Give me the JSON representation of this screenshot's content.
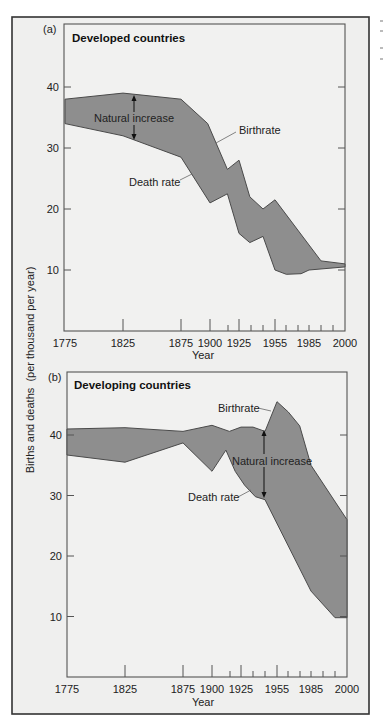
{
  "figure": {
    "ylabel": "Births and deaths  (per thousand per year)",
    "xlabel": "Year",
    "colors": {
      "band_fill": "#8e8e8e",
      "band_stroke": "#4a4a4a",
      "background": "#f1f1f0"
    }
  },
  "chart_data": [
    {
      "type": "area",
      "panel": "(a)",
      "title": "Developed countries",
      "xlabel": "Year",
      "ylabel": "Births and deaths (per thousand per year)",
      "x_tick_labels": [
        "1775",
        "1825",
        "1875",
        "1900",
        "1925",
        "1955",
        "1985",
        "2000"
      ],
      "y_ticks": [
        10,
        20,
        30,
        40
      ],
      "ylim": [
        0,
        47
      ],
      "xlim": [
        1775,
        2000
      ],
      "grid": false,
      "annotations": [
        "Natural increase",
        "Birthrate",
        "Death rate"
      ],
      "series": [
        {
          "name": "Birthrate",
          "x": [
            1775,
            1825,
            1875,
            1898,
            1915,
            1925,
            1934,
            1945,
            1955,
            1990,
            2000
          ],
          "values": [
            38,
            39,
            38,
            34,
            26.5,
            28,
            22,
            20,
            21.5,
            11.5,
            11
          ]
        },
        {
          "name": "Death rate",
          "x": [
            1775,
            1825,
            1875,
            1900,
            1915,
            1925,
            1934,
            1945,
            1955,
            1965,
            1978,
            1985,
            2000
          ],
          "values": [
            34,
            32,
            28.5,
            21,
            22.5,
            16,
            14.5,
            15.5,
            10,
            9.3,
            9.4,
            10,
            10.5
          ]
        }
      ]
    },
    {
      "type": "area",
      "panel": "(b)",
      "title": "Developing countries",
      "xlabel": "Year",
      "ylabel": "Births and deaths (per thousand per year)",
      "x_tick_labels": [
        "1775",
        "1825",
        "1875",
        "1900",
        "1925",
        "1955",
        "1985",
        "2000"
      ],
      "y_ticks": [
        10,
        20,
        30,
        40
      ],
      "ylim": [
        0,
        47
      ],
      "xlim": [
        1775,
        2000
      ],
      "grid": false,
      "annotations": [
        "Birthrate",
        "Natural increase",
        "Death rate"
      ],
      "series": [
        {
          "name": "Birthrate",
          "x": [
            1775,
            1825,
            1875,
            1900,
            1915,
            1925,
            1935,
            1945,
            1955,
            1965,
            1975,
            1985,
            2000
          ],
          "values": [
            41,
            41.2,
            40.6,
            41.6,
            40.6,
            41.3,
            41.3,
            40.6,
            45.5,
            43.8,
            41.5,
            35,
            26
          ]
        },
        {
          "name": "Death rate",
          "x": [
            1775,
            1825,
            1875,
            1900,
            1912,
            1920,
            1928,
            1937,
            1945,
            1985,
            1995,
            2000
          ],
          "values": [
            36.7,
            35.5,
            38.7,
            34,
            37.5,
            34,
            31.7,
            29.8,
            29.3,
            14.2,
            9.8,
            9.8
          ]
        }
      ]
    }
  ],
  "panels": [
    {
      "letter": "(a)",
      "title": "Developed countries",
      "labels": {
        "natural_increase": "Natural increase",
        "birthrate": "Birthrate",
        "death_rate": "Death rate"
      }
    },
    {
      "letter": "(b)",
      "title": "Developing countries",
      "labels": {
        "natural_increase": "Natural increase",
        "birthrate": "Birthrate",
        "death_rate": "Death rate"
      }
    }
  ],
  "axes": {
    "x_ticks": [
      {
        "label": "1775",
        "px": 66,
        "major": false,
        "labeled": true
      },
      {
        "label": "1825",
        "px": 124,
        "major": true,
        "labeled": true
      },
      {
        "label": "1875",
        "px": 182,
        "major": true,
        "labeled": true
      },
      {
        "label": "1900",
        "px": 211,
        "major": true,
        "labeled": true
      },
      {
        "label": "",
        "px": 229,
        "major": false,
        "labeled": false
      },
      {
        "label": "1925",
        "px": 240,
        "major": true,
        "labeled": true
      },
      {
        "label": "",
        "px": 252,
        "major": false,
        "labeled": false
      },
      {
        "label": "",
        "px": 264,
        "major": false,
        "labeled": false
      },
      {
        "label": "1955",
        "px": 276,
        "major": true,
        "labeled": true
      },
      {
        "label": "",
        "px": 287,
        "major": false,
        "labeled": false
      },
      {
        "label": "",
        "px": 299,
        "major": false,
        "labeled": false
      },
      {
        "label": "1985",
        "px": 310,
        "major": false,
        "labeled": true
      },
      {
        "label": "",
        "px": 322,
        "major": false,
        "labeled": false
      },
      {
        "label": "",
        "px": 334,
        "major": false,
        "labeled": false
      },
      {
        "label": "2000",
        "px": 346,
        "major": false,
        "labeled": true
      }
    ],
    "y_ticks": [
      "10",
      "20",
      "30",
      "40"
    ]
  }
}
